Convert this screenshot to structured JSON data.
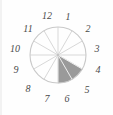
{
  "figure": {
    "kind": "clock-face-sector-diagram",
    "background_color": "#fefefe",
    "outline_color": "#c9c9c9",
    "spoke_color": "#d8d8d8",
    "shaded_color": "#9a9a9a",
    "label_color": "#4a4a4a",
    "center": {
      "x": 58,
      "y": 55
    },
    "radius": 28
  },
  "chart_data": {
    "type": "pie",
    "title": "",
    "xlabel": "",
    "ylabel": "",
    "legend": "none",
    "grid": false,
    "categories": [
      "1",
      "2",
      "3",
      "4",
      "5",
      "6",
      "7",
      "8",
      "9",
      "10",
      "11",
      "12"
    ],
    "values": [
      1,
      1,
      1,
      1,
      1,
      1,
      1,
      1,
      1,
      1,
      1,
      1
    ],
    "sector_count": 12,
    "sector_degrees": 30,
    "shaded_sectors": [
      "4",
      "5"
    ],
    "shaded_start_hour": 4,
    "shaded_end_hour": 6,
    "shaded_start_degrees": 120,
    "shaded_end_degrees": 180,
    "colors": {
      "shaded": "#9a9a9a",
      "unshaded": "#ffffff"
    }
  },
  "hours": [
    {
      "label": "12",
      "hour": 12,
      "x": 47,
      "y": 16
    },
    {
      "label": "1",
      "hour": 1,
      "x": 68,
      "y": 17
    },
    {
      "label": "2",
      "hour": 2,
      "x": 88,
      "y": 29
    },
    {
      "label": "3",
      "hour": 3,
      "x": 97,
      "y": 49
    },
    {
      "label": "4",
      "hour": 4,
      "x": 98,
      "y": 70
    },
    {
      "label": "5",
      "hour": 5,
      "x": 87,
      "y": 90
    },
    {
      "label": "6",
      "hour": 6,
      "x": 67,
      "y": 99
    },
    {
      "label": "7",
      "hour": 7,
      "x": 47,
      "y": 99
    },
    {
      "label": "8",
      "hour": 8,
      "x": 28,
      "y": 89
    },
    {
      "label": "9",
      "hour": 9,
      "x": 16,
      "y": 70
    },
    {
      "label": "10",
      "hour": 10,
      "x": 15,
      "y": 49
    },
    {
      "label": "11",
      "hour": 11,
      "x": 28,
      "y": 29
    }
  ]
}
